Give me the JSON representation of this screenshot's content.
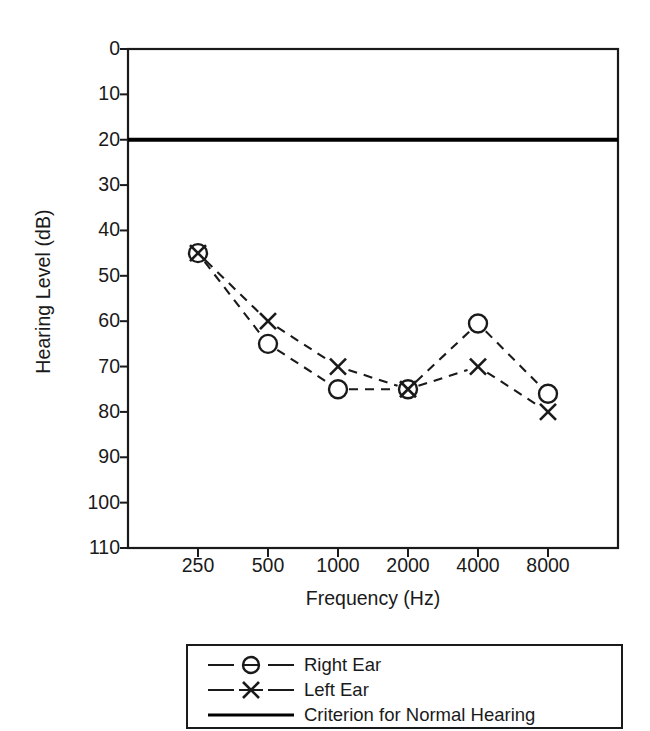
{
  "chart_data": {
    "type": "line",
    "title": "",
    "subtitle": "",
    "xlabel": "Frequency (Hz)",
    "ylabel": "Hearing Level (dB)",
    "x": [
      250,
      500,
      1000,
      2000,
      4000,
      8000
    ],
    "categories": [
      "250",
      "500",
      "1000",
      "2000",
      "4000",
      "8000"
    ],
    "xtick_labels": [
      "250",
      "500",
      "1000",
      "2000",
      "4000",
      "8000"
    ],
    "ytick_labels": [
      "0",
      "10",
      "20",
      "30",
      "40",
      "50",
      "60",
      "70",
      "80",
      "90",
      "100",
      "110"
    ],
    "yticks": [
      0,
      10,
      20,
      30,
      40,
      50,
      60,
      70,
      80,
      90,
      100,
      110
    ],
    "ylim": [
      0,
      110
    ],
    "y_axis_inverted": true,
    "x_scale": "categorical-log",
    "grid": false,
    "legend_position": "below-plot",
    "series": [
      {
        "name": "Right Ear",
        "marker": "circle",
        "linestyle": "dashed",
        "color": "#1a1a1a",
        "values": [
          45,
          65,
          75,
          75,
          60.5,
          76
        ]
      },
      {
        "name": "Left Ear",
        "marker": "x",
        "linestyle": "dashed",
        "color": "#1a1a1a",
        "values": [
          45,
          60,
          70,
          75,
          70,
          80
        ]
      }
    ],
    "reference_lines": [
      {
        "name": "Criterion for Normal Hearing",
        "value": 20,
        "orientation": "horizontal",
        "linestyle": "solid",
        "color": "#000000"
      }
    ]
  },
  "legend": {
    "items": [
      {
        "label": "Right Ear",
        "sample": "dashed-line-circle-marker"
      },
      {
        "label": "Left Ear",
        "sample": "dashed-line-x-marker"
      },
      {
        "label": "Criterion for Normal Hearing",
        "sample": "solid-line"
      }
    ]
  },
  "colors": {
    "foreground": "#1a1a1a",
    "axis": "#1a1a1a",
    "background": "#ffffff",
    "criterion": "#000000"
  }
}
